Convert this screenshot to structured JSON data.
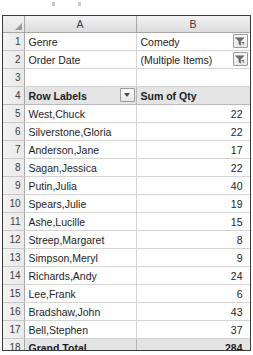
{
  "window": {
    "app": "spreadsheet-pivot-table"
  },
  "column_headers": {
    "corner": "",
    "a": "A",
    "b": "B"
  },
  "icons": {
    "filter": "filter-funnel-icon",
    "dropdown": "chevron-down-icon",
    "corner": "select-all-triangle-icon"
  },
  "rows": [
    {
      "n": "1",
      "a": "Genre",
      "b": "Comedy",
      "button": "filter"
    },
    {
      "n": "2",
      "a": "Order Date",
      "b": "(Multiple Items)",
      "button": "filter"
    },
    {
      "n": "3",
      "a": "",
      "b": "",
      "button": "none"
    },
    {
      "n": "4",
      "a": "Row Labels",
      "b": "Sum of Qty",
      "button": "dropdown"
    },
    {
      "n": "5",
      "a": "West,Chuck",
      "b": "22",
      "button": "none"
    },
    {
      "n": "6",
      "a": "Silverstone,Gloria",
      "b": "22",
      "button": "none"
    },
    {
      "n": "7",
      "a": "Anderson,Jane",
      "b": "17",
      "button": "none"
    },
    {
      "n": "8",
      "a": "Sagan,Jessica",
      "b": "22",
      "button": "none"
    },
    {
      "n": "9",
      "a": "Putin,Julia",
      "b": "40",
      "button": "none"
    },
    {
      "n": "10",
      "a": "Spears,Julie",
      "b": "19",
      "button": "none"
    },
    {
      "n": "11",
      "a": "Ashe,Lucille",
      "b": "15",
      "button": "none"
    },
    {
      "n": "12",
      "a": "Streep,Margaret",
      "b": "8",
      "button": "none"
    },
    {
      "n": "13",
      "a": "Simpson,Meryl",
      "b": "9",
      "button": "none"
    },
    {
      "n": "14",
      "a": "Richards,Andy",
      "b": "24",
      "button": "none"
    },
    {
      "n": "15",
      "a": "Lee,Frank",
      "b": "6",
      "button": "none"
    },
    {
      "n": "16",
      "a": "Bradshaw,John",
      "b": "43",
      "button": "none"
    },
    {
      "n": "17",
      "a": "Bell,Stephen",
      "b": "37",
      "button": "none"
    },
    {
      "n": "18",
      "a": "Grand Total",
      "b": "284",
      "button": "none"
    }
  ],
  "colors": {
    "grid_line": "#d4d4d4",
    "header_fill": "#e6e6e6",
    "band_fill": "#e4e4e4",
    "text": "#1d1d1d",
    "border": "#3a3a3a"
  }
}
